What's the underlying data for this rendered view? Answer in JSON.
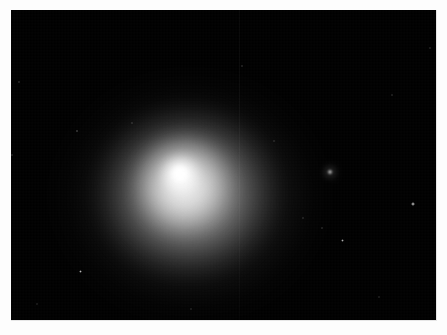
{
  "image": {
    "kind": "astronomical-photograph",
    "subject": "comet",
    "caption": "",
    "canvas": {
      "width": 447,
      "height": 335
    },
    "frame": {
      "x": 11,
      "y": 10,
      "width": 426,
      "height": 311,
      "background_hex": "#000000"
    },
    "page_background_hex": "#fdfdfd"
  },
  "chart_data": {
    "type": "scatter",
    "title": "",
    "subtitle": "",
    "xlabel": "",
    "ylabel": "",
    "grid": false,
    "legend": null,
    "xlim": [
      0,
      426
    ],
    "ylim": [
      0,
      311
    ],
    "annotations": [],
    "background_hex": "#000000",
    "nucleus": {
      "label": "comet-nucleus",
      "x": 169,
      "y": 164,
      "radius": 9,
      "peak_brightness": 255,
      "core_hex": "#ffffff"
    },
    "coma": {
      "label": "comet-coma",
      "x": 179,
      "y": 186,
      "radius_x": 132,
      "radius_y": 118,
      "peak_brightness": 150,
      "edge_brightness": 0,
      "glow_hex": "#d8d8d8"
    },
    "inner_coma": {
      "label": "inner-coma",
      "x": 172,
      "y": 172,
      "radius": 52,
      "peak_brightness": 205
    },
    "column_artifact": {
      "label": "ccd-column-artifact",
      "x": 228,
      "brightness": 28
    },
    "stars": [
      {
        "x": 8,
        "y": 72,
        "size": 2.0,
        "brightness": 120
      },
      {
        "x": 66,
        "y": 121,
        "size": 2.6,
        "brightness": 175
      },
      {
        "x": 1,
        "y": 145,
        "size": 1.8,
        "brightness": 110
      },
      {
        "x": 69,
        "y": 261,
        "size": 3.0,
        "brightness": 185
      },
      {
        "x": 121,
        "y": 113,
        "size": 1.6,
        "brightness": 95
      },
      {
        "x": 231,
        "y": 56,
        "size": 1.8,
        "brightness": 105
      },
      {
        "x": 319,
        "y": 162,
        "size": 5.2,
        "brightness": 245
      },
      {
        "x": 402,
        "y": 194,
        "size": 3.4,
        "brightness": 205
      },
      {
        "x": 331,
        "y": 230,
        "size": 3.0,
        "brightness": 175
      },
      {
        "x": 311,
        "y": 218,
        "size": 1.8,
        "brightness": 110
      },
      {
        "x": 292,
        "y": 208,
        "size": 1.6,
        "brightness": 95
      },
      {
        "x": 381,
        "y": 85,
        "size": 1.6,
        "brightness": 95
      },
      {
        "x": 263,
        "y": 131,
        "size": 1.4,
        "brightness": 85
      },
      {
        "x": 368,
        "y": 287,
        "size": 1.5,
        "brightness": 85
      },
      {
        "x": 26,
        "y": 294,
        "size": 1.4,
        "brightness": 80
      },
      {
        "x": 180,
        "y": 299,
        "size": 1.4,
        "brightness": 80
      },
      {
        "x": 419,
        "y": 38,
        "size": 1.6,
        "brightness": 95
      }
    ]
  }
}
